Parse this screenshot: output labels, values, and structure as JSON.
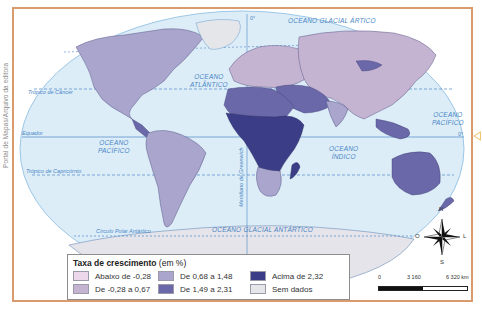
{
  "credit": "Portal de Mapas/Arquivo da editora",
  "map": {
    "oceans": {
      "arctic": "OCEANO GLACIAL ÁRTICO",
      "atlantic": [
        "OCEANO",
        "ATLÂNTICO"
      ],
      "pacific_east": [
        "OCEANO",
        "PACÍFICO"
      ],
      "pacific_west": [
        "OCEANO",
        "PACÍFICO"
      ],
      "indian": [
        "OCEANO",
        "ÍNDICO"
      ],
      "antarctic": "OCEANO GLACIAL ANTÁRTICO"
    },
    "lines": {
      "tropic_cancer": "Trópico de Câncer",
      "equator": "Equador",
      "tropic_capricorn": "Trópico de Capricórnio",
      "antarctic_circle": "Círculo Polar Antártico",
      "greenwich": "Meridiano de Greenwich",
      "equator_degree": "0°",
      "meridian_degree": "0°"
    },
    "colors": {
      "ocean": "#dcedf8",
      "ocean_border": "#9cc7e6",
      "lines": "#4a86c5",
      "frame": "#d99a6c",
      "antarctica": "#e4e4ea"
    }
  },
  "legend": {
    "title_bold": "Taxa de crescimento",
    "title_unit": " (em %)",
    "items": [
      {
        "label": "Abaixo de -0,28",
        "color": "#ecd8ea"
      },
      {
        "label": "De 0,68 a 1,48",
        "color": "#a9a5cc"
      },
      {
        "label": "Acima de 2,32",
        "color": "#3b3e86"
      },
      {
        "label": "De -0,28 a 0,67",
        "color": "#c4b4d2"
      },
      {
        "label": "De 1,49 a 2,31",
        "color": "#6a68a8"
      },
      {
        "label": "Sem dados",
        "color": "#e4e6ea"
      }
    ]
  },
  "compass": {
    "n": "N",
    "s": "S",
    "o": "O",
    "l": "L"
  },
  "scale": {
    "ticks": [
      "0",
      "3 160",
      "6 320 km"
    ]
  }
}
